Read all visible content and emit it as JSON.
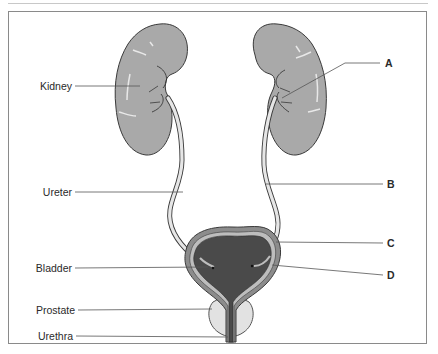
{
  "diagram": {
    "labels_left": [
      {
        "id": "kidney",
        "text": "Kidney"
      },
      {
        "id": "ureter",
        "text": "Ureter"
      },
      {
        "id": "bladder",
        "text": "Bladder"
      },
      {
        "id": "prostate",
        "text": "Prostate"
      },
      {
        "id": "urethra",
        "text": "Urethra"
      }
    ],
    "labels_right": [
      {
        "id": "a",
        "text": "A"
      },
      {
        "id": "b",
        "text": "B"
      },
      {
        "id": "c",
        "text": "C"
      },
      {
        "id": "d",
        "text": "D"
      }
    ],
    "colors": {
      "kidney_fill": "#a9a9a9",
      "outline": "#3a3a3a",
      "bladder_lumen": "#4a4a4a",
      "bladder_wall": "#8c8c8c",
      "ureter_fill": "#e6e6e6",
      "prostate_fill": "#e2e2e2",
      "leader_line": "#555555"
    }
  }
}
